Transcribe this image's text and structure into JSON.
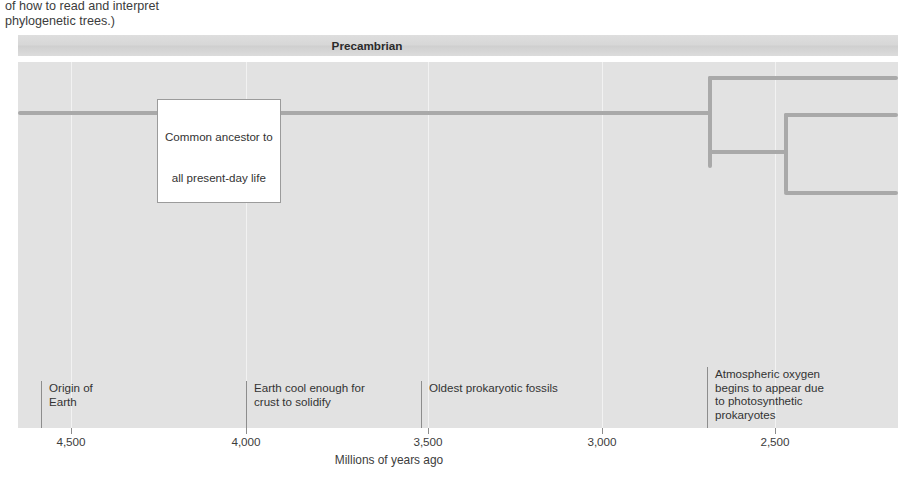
{
  "caption_tail": {
    "line1": "of how to read and interpret",
    "line2": "phylogenetic trees.)"
  },
  "era_band": {
    "label": "Precambrian"
  },
  "callout": {
    "line1": "Common ancestor to",
    "line2": "all present-day life"
  },
  "axis": {
    "title": "Millions of years ago",
    "ticks": [
      {
        "label": "4,500",
        "x": 71
      },
      {
        "label": "4,000",
        "x": 246
      },
      {
        "label": "3,500",
        "x": 428
      },
      {
        "label": "3,000",
        "x": 602
      },
      {
        "label": "2,500",
        "x": 775
      }
    ]
  },
  "events": [
    {
      "name": "origin-of-earth",
      "x": 41,
      "y": 381,
      "lines": [
        "Origin of",
        "Earth"
      ]
    },
    {
      "name": "crust-solidify",
      "x": 246,
      "y": 381,
      "lines": [
        "Earth cool enough for",
        "crust to solidify"
      ]
    },
    {
      "name": "oldest-prokaryotic-fossils",
      "x": 421,
      "y": 381,
      "lines": [
        "Oldest prokaryotic fossils"
      ]
    },
    {
      "name": "atmospheric-oxygen",
      "x": 707,
      "y": 367,
      "lines": [
        "Atmospheric oxygen",
        "begins to appear due",
        "to photosynthetic",
        "prokaryotes"
      ]
    }
  ],
  "chart_data": {
    "type": "line",
    "xlabel": "Millions of years ago",
    "ylabel": "",
    "xlim": [
      4700,
      2250
    ],
    "xticks": [
      4500,
      4000,
      3500,
      3000,
      2500
    ],
    "grid": true,
    "legend": "none",
    "annotations": [
      {
        "label": "Origin of Earth",
        "mya": 4600
      },
      {
        "label": "Earth cool enough for crust to solidify",
        "mya": 4000
      },
      {
        "label": "Oldest prokaryotic fossils",
        "mya": 3500
      },
      {
        "label": "Atmospheric oxygen begins to appear due to photosynthetic prokaryotes",
        "mya": 2700
      },
      {
        "label": "Common ancestor to all present-day life",
        "mya": 4350
      }
    ],
    "tree_nodes": [
      {
        "name": "root-trunk",
        "mya_start": 4350,
        "mya_end": 2740,
        "depth": 0
      },
      {
        "name": "first-split",
        "mya": 2740,
        "children": 2
      },
      {
        "name": "second-split",
        "mya": 2520,
        "children": 2
      }
    ],
    "tree_tips": 3
  },
  "colors": {
    "panel": "#e2e2e2",
    "band": "#d7d7d7",
    "branch": "#a9a9a9",
    "gridline": "#f2f2f2",
    "text": "#333333"
  }
}
